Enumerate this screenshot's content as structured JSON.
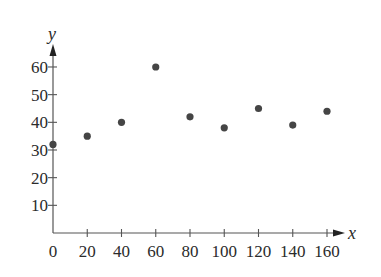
{
  "chart_data": {
    "type": "scatter",
    "title": "",
    "xlabel": "x",
    "ylabel": "y",
    "x": [
      0,
      20,
      40,
      60,
      80,
      100,
      120,
      140,
      160
    ],
    "y": [
      32,
      35,
      40,
      60,
      42,
      38,
      45,
      39,
      44
    ],
    "xlim": [
      0,
      170
    ],
    "ylim": [
      0,
      67
    ],
    "x_ticks": [
      0,
      20,
      40,
      60,
      80,
      100,
      120,
      140,
      160
    ],
    "y_ticks": [
      10,
      20,
      30,
      40,
      50,
      60
    ],
    "x_tick_labels": [
      "0",
      "20",
      "40",
      "60",
      "80",
      "100",
      "120",
      "140",
      "160"
    ],
    "y_tick_labels": [
      "10",
      "20",
      "30",
      "40",
      "50",
      "60"
    ],
    "grid": false,
    "legend": null,
    "colors": {
      "points": "#454545",
      "axes": "#555555",
      "text": "#2b2b2b"
    }
  },
  "layout": {
    "origin_px": [
      53,
      233
    ],
    "px_per_x_unit": 1.7125,
    "px_per_y_unit": 2.767,
    "x_axis_end_px": 345,
    "y_axis_top_px": 44,
    "dot_radius": 3.6
  }
}
